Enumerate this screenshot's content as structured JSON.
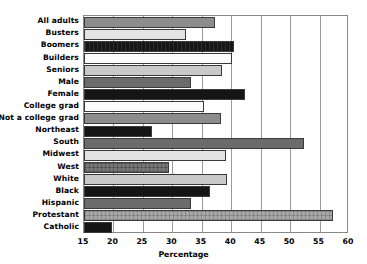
{
  "chart_data": {
    "type": "bar",
    "orientation": "horizontal",
    "title": "",
    "xlabel": "Percentage",
    "ylabel": "",
    "xlim": [
      15,
      60
    ],
    "xticks": [
      15,
      20,
      25,
      30,
      35,
      40,
      45,
      50,
      55,
      60
    ],
    "grid": true,
    "legend": null,
    "categories": [
      "All adults",
      "Busters",
      "Boomers",
      "Builders",
      "Seniors",
      "Male",
      "Female",
      "College grad",
      "Not a college grad",
      "Northeast",
      "South",
      "Midwest",
      "West",
      "White",
      "Black",
      "Hispanic",
      "Protestant",
      "Catholic"
    ],
    "values": [
      37.2,
      32.3,
      40.4,
      40.1,
      38.4,
      33.2,
      42.3,
      35.3,
      38.2,
      26.6,
      52.4,
      39.1,
      29.4,
      39.2,
      36.4,
      33.2,
      57.3,
      19.8
    ],
    "bar_styles": [
      "midgrey",
      "lightgrey",
      "blackhatch",
      "white",
      "palegrey",
      "darkgrey",
      "black",
      "white",
      "midgrey",
      "black",
      "darkgrey",
      "lightgrey",
      "hatchdark",
      "palegrey",
      "black",
      "darkgrey",
      "hatchgrey",
      "black"
    ]
  }
}
